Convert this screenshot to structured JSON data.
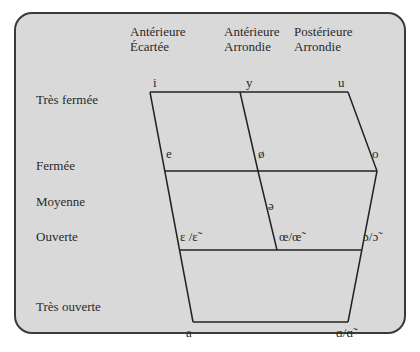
{
  "columns": [
    {
      "line1": "Antérieure",
      "line2": "Écartée"
    },
    {
      "line1": "Antérieure",
      "line2": "Arrondie"
    },
    {
      "line1": "Postérieure",
      "line2": "Arrondie"
    }
  ],
  "rows": [
    "Très fermée",
    "Fermée",
    "Moyenne",
    "Ouverte",
    "Très ouverte"
  ],
  "vowels": {
    "i": "i",
    "y": "y",
    "u": "u",
    "e": "e",
    "o_slash": "ø",
    "o": "o",
    "schwa": "ə",
    "epsilon": "ɛ /ɛ̃",
    "oe": "œ/œ̃",
    "open_o": "ɔ/ɔ̃",
    "a": "a",
    "alpha": "ɑ/ɑ̃"
  },
  "colors": {
    "panel": "#d9d9d9",
    "line": "#222222",
    "text": "#2a2a2a"
  }
}
